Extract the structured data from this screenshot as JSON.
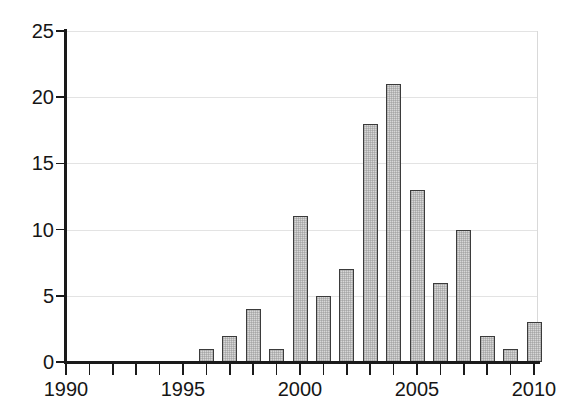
{
  "chart_data": {
    "type": "bar",
    "title": "",
    "subtitle": "",
    "xlabel": "",
    "ylabel": "",
    "categories": [
      1990,
      1991,
      1992,
      1993,
      1994,
      1995,
      1996,
      1997,
      1998,
      1999,
      2000,
      2001,
      2002,
      2003,
      2004,
      2005,
      2006,
      2007,
      2008,
      2009,
      2010
    ],
    "values": [
      0,
      0,
      0,
      0,
      0,
      0,
      1,
      2,
      4,
      1,
      11,
      5,
      7,
      18,
      21,
      13,
      6,
      10,
      2,
      1,
      3
    ],
    "xlim": [
      1989.5,
      2010.5
    ],
    "ylim": [
      0,
      25
    ],
    "y_ticks": [
      0,
      5,
      10,
      15,
      20,
      25
    ],
    "y_tick_labels": [
      "0",
      "5",
      "10",
      "15",
      "20",
      "25"
    ],
    "x_ticks": [
      1990,
      1991,
      1992,
      1993,
      1994,
      1995,
      1996,
      1997,
      1998,
      1999,
      2000,
      2001,
      2002,
      2003,
      2004,
      2005,
      2006,
      2007,
      2008,
      2009,
      2010
    ],
    "x_tick_labels_shown": [
      "1990",
      "1995",
      "2000",
      "2005",
      "2010"
    ],
    "x_labeled_ticks": [
      1990,
      1995,
      2000,
      2005,
      2010
    ],
    "grid": "horizontal",
    "legend": null,
    "legend_position": "none",
    "bar_fill_color": "#d7d7d7",
    "bar_edge_color": "#3b3b3b",
    "grid_color": "#e3e3e3",
    "axis_color": "#1a1a1a",
    "background_color": "#ffffff"
  }
}
